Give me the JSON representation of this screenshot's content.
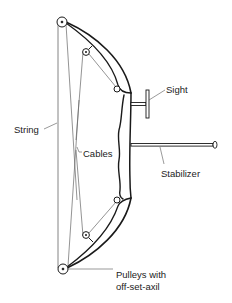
{
  "diagram": {
    "labels": {
      "sight": "Sight",
      "string": "String",
      "cables": "Cables",
      "stabilizer": "Stabilizer",
      "pulleys_line1": "Pulleys with",
      "pulleys_line2": "off-set-axil"
    },
    "colors": {
      "line": "#1a1a1a",
      "thin_line": "#555555",
      "label": "#222222",
      "background": "#ffffff"
    }
  }
}
